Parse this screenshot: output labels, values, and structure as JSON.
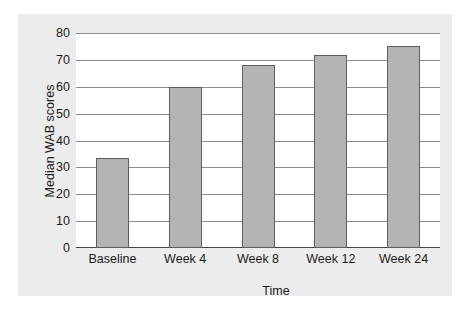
{
  "chart_data": {
    "type": "bar",
    "title": "",
    "xlabel": "Time",
    "ylabel": "Median WAB scores",
    "categories": [
      "Baseline",
      "Week 4",
      "Week 8",
      "Week 12",
      "Week 24"
    ],
    "values": [
      33.5,
      60,
      68,
      72,
      75
    ],
    "series": [
      {
        "name": "Median WAB scores",
        "values": [
          33.5,
          60,
          68,
          72,
          75
        ]
      }
    ],
    "ylim": [
      0,
      80
    ],
    "ytick_labels": [
      "0",
      "10",
      "20",
      "30",
      "40",
      "50",
      "60",
      "70",
      "80"
    ],
    "ytick_values": [
      0,
      10,
      20,
      30,
      40,
      50,
      60,
      70,
      80
    ],
    "grid": true,
    "legend": false,
    "legend_position": "none",
    "colors": {
      "bar_fill": "#b4b4b4",
      "bar_edge": "#5e5e5e",
      "gridline": "#8c8c8c",
      "axis_line": "#444444",
      "panel_background": "#ececec",
      "plot_background": "#ffffff",
      "text": "#1a1a1a"
    }
  }
}
